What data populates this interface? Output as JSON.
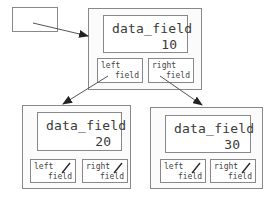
{
  "diagram": {
    "root_pointer": {
      "label": ""
    },
    "nodes": [
      {
        "id": "root",
        "data_label": "data_field",
        "value": "10",
        "left": {
          "line1": "left",
          "line2": "field",
          "null": false
        },
        "right": {
          "line1": "right",
          "line2": "field",
          "null": false
        }
      },
      {
        "id": "left-child",
        "data_label": "data_field",
        "value": "20",
        "left": {
          "line1": "left",
          "line2": "field",
          "null": true
        },
        "right": {
          "line1": "right",
          "line2": "field",
          "null": true
        }
      },
      {
        "id": "right-child",
        "data_label": "data_field",
        "value": "30",
        "left": {
          "line1": "left",
          "line2": "field",
          "null": true
        },
        "right": {
          "line1": "right",
          "line2": "field",
          "null": true
        }
      }
    ],
    "colors": {
      "border": "#888888",
      "text": "#3a3a3a",
      "arrow": "#222222"
    }
  }
}
